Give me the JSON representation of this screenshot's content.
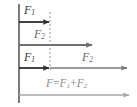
{
  "figure": {
    "background": "#ffffff",
    "width": 137,
    "height": 107,
    "wall": {
      "name": "vertical-wall-line",
      "x": 19,
      "y1": 4,
      "y2": 103,
      "color": "#5a5a5a",
      "width": 1.6
    },
    "dashed_guide": {
      "name": "dashed-reference-line",
      "x": 50,
      "y1": 12,
      "y2": 70,
      "color": "#9a9a9a",
      "dash": "2,2",
      "width": 1
    },
    "arrows": [
      {
        "id": "arrow-f1-top",
        "label": "F",
        "subscript": "1",
        "y": 22,
        "x_start": 19,
        "x_end": 50,
        "color": "#2e2e2e",
        "width": 1.8,
        "label_x": 24,
        "label_y": 5,
        "label_tone": "lbl-dark"
      },
      {
        "id": "arrow-f2-middle",
        "label": "F",
        "subscript": "2",
        "y": 45,
        "x_start": 19,
        "x_end": 93,
        "color": "#6f6f6f",
        "width": 1.8,
        "label_x": 34,
        "label_y": 29,
        "label_tone": "lbl-mid"
      },
      {
        "id": "arrow-f1-bottom",
        "label": "F",
        "subscript": "1",
        "y": 68,
        "x_start": 19,
        "x_end": 50,
        "color": "#2e2e2e",
        "width": 1.8,
        "label_x": 24,
        "label_y": 52,
        "label_tone": "lbl-dark"
      },
      {
        "id": "arrow-f2-bottom",
        "label": "F",
        "subscript": "2",
        "y": 68,
        "x_start": 50,
        "x_end": 128,
        "color": "#7a7a7a",
        "width": 1.5,
        "label_x": 82,
        "label_y": 52,
        "label_tone": "lbl-mid"
      },
      {
        "id": "arrow-resultant",
        "label": "F",
        "subscript": "",
        "y": 95,
        "x_start": 19,
        "x_end": 130,
        "color": "#a6a6a6",
        "width": 1.4,
        "label_x": 46,
        "label_y": 79,
        "label_tone": "lbl-lite"
      }
    ],
    "equation": {
      "name": "resultant-force-equation",
      "text": "F=F1+F2",
      "parts": {
        "lhs": "F",
        "equals": "=",
        "term1": "F",
        "term1_sub": "1",
        "plus": "+",
        "term2": "F",
        "term2_sub": "2"
      },
      "x": 46,
      "y": 79
    }
  }
}
